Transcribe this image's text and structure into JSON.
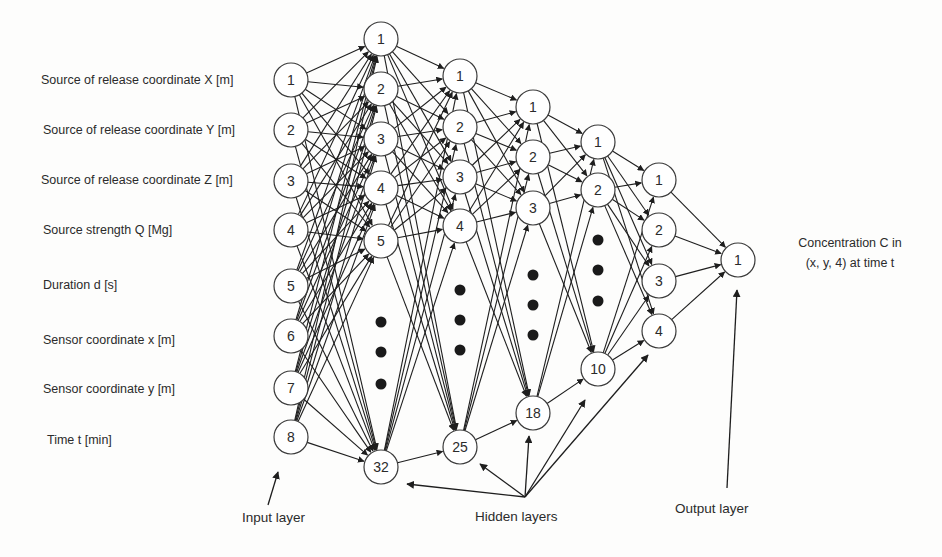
{
  "figure": {
    "type": "neural-network-architecture",
    "colors": {
      "line": "#1e1e1e",
      "node_fill": "#ffffff",
      "node_stroke": "#3a3a3a",
      "text": "#2b2b2b",
      "background": "#fdfdfc"
    }
  },
  "inputs": {
    "caption": "Input layer",
    "labels": [
      "Source of release coordinate X [m]",
      "Source of release coordinate Y [m]",
      "Source of release coordinate Z [m]",
      "Source strength Q [Mg]",
      "Duration d [s]",
      "Sensor coordinate x [m]",
      "Sensor coordinate y [m]",
      "Time t [min]"
    ]
  },
  "hidden_caption": "Hidden layers",
  "output_caption": "Output layer",
  "output_description": {
    "line1": "Concentration C in",
    "line2": "(x, y, 4) at time t"
  },
  "layers": [
    {
      "name": "input",
      "x": 291,
      "r": 17,
      "nodes": [
        {
          "label": "1",
          "y": 80
        },
        {
          "label": "2",
          "y": 130
        },
        {
          "label": "3",
          "y": 181
        },
        {
          "label": "4",
          "y": 230
        },
        {
          "label": "5",
          "y": 286
        },
        {
          "label": "6",
          "y": 336
        },
        {
          "label": "7",
          "y": 388
        },
        {
          "label": "8",
          "y": 437
        }
      ],
      "dots": []
    },
    {
      "name": "hidden-1",
      "x": 381,
      "r": 17,
      "nodes": [
        {
          "label": "1",
          "y": 39
        },
        {
          "label": "2",
          "y": 89
        },
        {
          "label": "3",
          "y": 139
        },
        {
          "label": "4",
          "y": 188
        },
        {
          "label": "5",
          "y": 241
        },
        {
          "label": "32",
          "y": 467
        }
      ],
      "dots": [
        322,
        352,
        384
      ]
    },
    {
      "name": "hidden-2",
      "x": 460,
      "r": 17,
      "nodes": [
        {
          "label": "1",
          "y": 76
        },
        {
          "label": "2",
          "y": 127
        },
        {
          "label": "3",
          "y": 177
        },
        {
          "label": "4",
          "y": 226
        },
        {
          "label": "25",
          "y": 447
        }
      ],
      "dots": [
        290,
        320,
        350
      ]
    },
    {
      "name": "hidden-3",
      "x": 533,
      "r": 17,
      "nodes": [
        {
          "label": "1",
          "y": 107
        },
        {
          "label": "2",
          "y": 157
        },
        {
          "label": "3",
          "y": 208
        },
        {
          "label": "18",
          "y": 413
        }
      ],
      "dots": [
        275,
        305,
        335
      ]
    },
    {
      "name": "hidden-4",
      "x": 598,
      "r": 17,
      "nodes": [
        {
          "label": "1",
          "y": 142
        },
        {
          "label": "2",
          "y": 190
        },
        {
          "label": "10",
          "y": 369
        }
      ],
      "dots": [
        240,
        270,
        301
      ]
    },
    {
      "name": "hidden-5",
      "x": 659,
      "r": 17,
      "nodes": [
        {
          "label": "1",
          "y": 180
        },
        {
          "label": "2",
          "y": 230
        },
        {
          "label": "3",
          "y": 281
        },
        {
          "label": "4",
          "y": 331
        }
      ],
      "dots": []
    },
    {
      "name": "output",
      "x": 738,
      "r": 17,
      "nodes": [
        {
          "label": "1",
          "y": 260
        }
      ],
      "dots": []
    }
  ],
  "pointer_arrows": {
    "input": {
      "from": [
        268,
        505
      ],
      "to": [
        278,
        472
      ]
    },
    "hidden": {
      "root": [
        525,
        497
      ],
      "targets": [
        [
          407,
          484
        ],
        [
          480,
          464
        ],
        [
          529,
          436
        ],
        [
          585,
          400
        ],
        [
          648,
          355
        ]
      ]
    },
    "output": {
      "from": [
        727,
        488
      ],
      "to": [
        737,
        290
      ]
    }
  }
}
